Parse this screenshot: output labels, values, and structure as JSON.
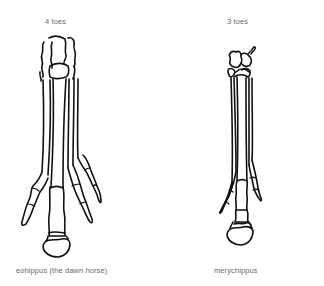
{
  "figures": [
    {
      "toe_label": "4 toes",
      "species_label": "eohippus (the dawn horse)"
    },
    {
      "toe_label": "3 toes",
      "species_label": "merychippus"
    }
  ],
  "colors": {
    "background": "#ffffff",
    "line": "#111111",
    "label_text": "#6b6b6b"
  }
}
